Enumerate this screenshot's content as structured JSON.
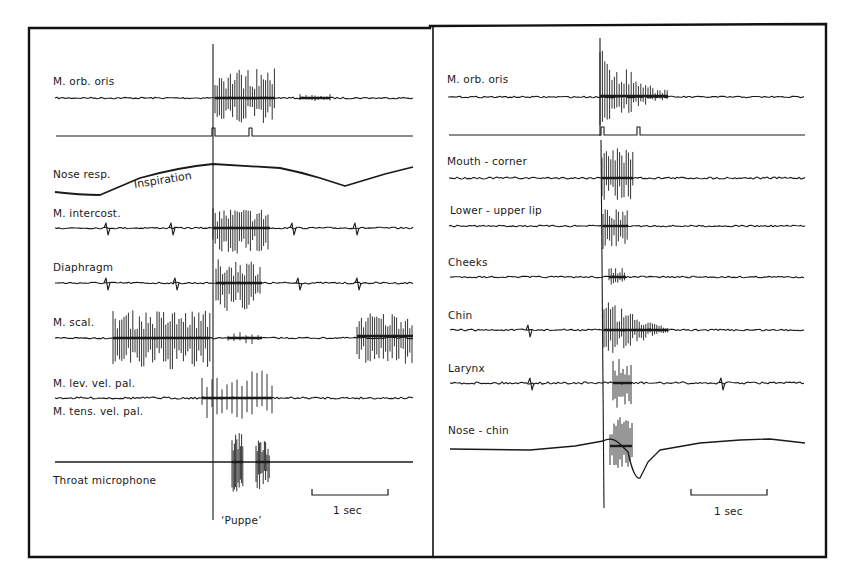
{
  "figure": {
    "left_panel": {
      "channels": [
        {
          "label": "M. orb. oris"
        },
        {
          "label": ""
        },
        {
          "label": "Nose resp."
        },
        {
          "label": "M. intercost."
        },
        {
          "label": "Diaphragm"
        },
        {
          "label": "M. scal."
        },
        {
          "label": "M. lev. vel. pal."
        },
        {
          "label": "M. tens. vel. pal."
        },
        {
          "label": "Throat microphone"
        }
      ],
      "annotation_inspiration": "Inspiration",
      "utterance_label": "‘Puppe’",
      "scale_bar_label": "1 sec"
    },
    "right_panel": {
      "channels": [
        {
          "label": "M. orb. oris"
        },
        {
          "label": ""
        },
        {
          "label": "Mouth - corner"
        },
        {
          "label": "Lower - upper lip"
        },
        {
          "label": "Cheeks"
        },
        {
          "label": "Chin"
        },
        {
          "label": "Larynx"
        },
        {
          "label": "Nose - chin"
        }
      ],
      "scale_bar_label": "1 sec"
    }
  },
  "chart_data": [
    {
      "type": "line",
      "title": "Left panel: respiratory and velar muscle activity during ‘Puppe’",
      "xlabel": "time",
      "ylabel": "",
      "x_scale": "scale bar = 1 sec",
      "grid": false,
      "series": [
        {
          "name": "M. orb. oris",
          "description": "EMG burst beginning at utterance marker, lasting ~0.6 s"
        },
        {
          "name": "Marker pulses",
          "description": "two pulses, at marker and ~0.5 s later"
        },
        {
          "name": "Nose resp.",
          "description": "slow respiratory curve; rises during inspiration to peak at marker, then falls, trough ~1.8 s later"
        },
        {
          "name": "M. intercost.",
          "description": "ECG-like spikes periodic; EMG burst at utterance"
        },
        {
          "name": "Diaphragm",
          "description": "ECG-like spikes; EMG burst at utterance"
        },
        {
          "name": "M. scal.",
          "description": "strong bursts before utterance (inspiration) and at end of trace"
        },
        {
          "name": "M. lev. vel. pal.",
          "description": "burst around utterance"
        },
        {
          "name": "M. tens. vel. pal.",
          "description": "burst around utterance"
        },
        {
          "name": "Throat microphone",
          "description": "two voiced syllables ‘Pup-pe’"
        }
      ],
      "annotations": [
        "Inspiration",
        "‘Puppe’",
        "1 sec"
      ]
    },
    {
      "type": "line",
      "title": "Right panel: facial and laryngeal muscle activity",
      "xlabel": "time",
      "ylabel": "",
      "x_scale": "scale bar = 1 sec",
      "grid": false,
      "series": [
        {
          "name": "M. orb. oris",
          "description": "large EMG burst at marker decaying over ~0.7 s"
        },
        {
          "name": "Marker pulses",
          "description": "two pulses ~0.5 s apart"
        },
        {
          "name": "Mouth - corner",
          "description": "burst at marker"
        },
        {
          "name": "Lower - upper lip",
          "description": "burst at marker"
        },
        {
          "name": "Cheeks",
          "description": "small burst at marker"
        },
        {
          "name": "Chin",
          "description": "burst at marker lasting ~0.6 s"
        },
        {
          "name": "Larynx",
          "description": "ECG spikes plus burst at marker"
        },
        {
          "name": "Nose - chin",
          "description": "burst with downward deflection after marker, slow recovery"
        }
      ],
      "annotations": [
        "1 sec"
      ]
    }
  ]
}
